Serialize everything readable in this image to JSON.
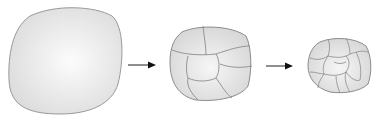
{
  "diagram": {
    "stages": [
      {
        "id": "single-cell",
        "cell_count": 1
      },
      {
        "id": "few-cells",
        "cell_count": 8
      },
      {
        "id": "many-cells",
        "cell_count": 16
      }
    ],
    "arrows": [
      {
        "from": "single-cell",
        "to": "few-cells"
      },
      {
        "from": "few-cells",
        "to": "many-cells"
      }
    ],
    "colors": {
      "fill": "#e6e6e6",
      "highlight": "#fafafa",
      "outline": "#8c8c8c",
      "arrow": "#222222"
    }
  }
}
